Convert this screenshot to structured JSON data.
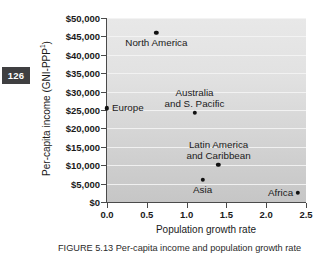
{
  "page_badge": {
    "number": "126"
  },
  "chart_data": {
    "type": "scatter",
    "title": "",
    "xlabel": "Population growth rate",
    "ylabel": "Per-capita income (GNI-PPP¹)",
    "ylabel_base": "Per-capita income (GNI-PPP",
    "ylabel_sup": "1",
    "ylabel_close": ")",
    "xlim": [
      0.0,
      2.5
    ],
    "ylim": [
      0,
      50000
    ],
    "grid": "horizontal",
    "legend": "none",
    "xticks": [
      "0.0",
      "0.5",
      "1.0",
      "1.5",
      "2.0",
      "2.5"
    ],
    "xtick_values": [
      0.0,
      0.5,
      1.0,
      1.5,
      2.0,
      2.5
    ],
    "yticks": [
      "$0",
      "$5,000",
      "$10,000",
      "$15,000",
      "$20,000",
      "$25,000",
      "$30,000",
      "$35,000",
      "$40,000",
      "$45,000",
      "$50,000"
    ],
    "ytick_values": [
      0,
      5000,
      10000,
      15000,
      20000,
      25000,
      30000,
      35000,
      40000,
      45000,
      50000
    ],
    "points": [
      {
        "label": "North America",
        "label_lines": [
          "North America"
        ],
        "x": 0.62,
        "y": 46000,
        "label_pos": "below"
      },
      {
        "label": "Europe",
        "label_lines": [
          "Europe"
        ],
        "x": 0.0,
        "y": 25500,
        "label_pos": "right"
      },
      {
        "label": "Australia and S. Pacific",
        "label_lines": [
          "Australia",
          "and S. Pacific"
        ],
        "x": 1.1,
        "y": 24300,
        "label_pos": "above"
      },
      {
        "label": "Latin America and Caribbean",
        "label_lines": [
          "Latin America",
          "and Caribbean"
        ],
        "x": 1.4,
        "y": 10100,
        "label_pos": "above"
      },
      {
        "label": "Asia",
        "label_lines": [
          "Asia"
        ],
        "x": 1.2,
        "y": 6000,
        "label_pos": "below"
      },
      {
        "label": "Africa",
        "label_lines": [
          "Africa"
        ],
        "x": 2.4,
        "y": 2500,
        "label_pos": "left"
      }
    ]
  },
  "caption": {
    "text": "FIGURE 5.13  Per-capita income and population growth rate"
  }
}
